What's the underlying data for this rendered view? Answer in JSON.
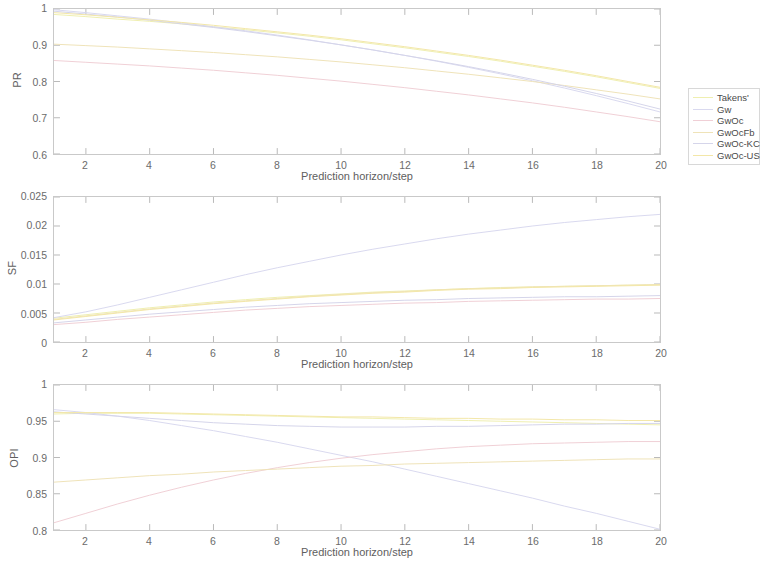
{
  "figure": {
    "xlabel": "Prediction horizon/step",
    "xticks": [
      "2",
      "4",
      "6",
      "8",
      "10",
      "12",
      "14",
      "16",
      "18",
      "20"
    ],
    "xlim": [
      1,
      20
    ]
  },
  "legend": {
    "entries": [
      {
        "label": "Takens'",
        "color": "#efefb0"
      },
      {
        "label": "Gw",
        "color": "#d9d9ef"
      },
      {
        "label": "GwOc",
        "color": "#f0cfd6"
      },
      {
        "label": "GwOcFb",
        "color": "#efe3b8"
      },
      {
        "label": "GwOc-KC",
        "color": "#d5d5ea"
      },
      {
        "label": "GwOc-US",
        "color": "#f3e7a8"
      }
    ]
  },
  "chart_data": [
    {
      "type": "line",
      "title": "",
      "panel": "PR",
      "ylabel": "PR",
      "xlabel": "Prediction horizon/step",
      "x": [
        1,
        2,
        3,
        4,
        5,
        6,
        7,
        8,
        9,
        10,
        11,
        12,
        13,
        14,
        15,
        16,
        17,
        18,
        19,
        20
      ],
      "ylim": [
        0.6,
        1.0
      ],
      "yticks": [
        "0.6",
        "0.7",
        "0.8",
        "0.9",
        "1"
      ],
      "xlim": [
        1,
        20
      ],
      "grid": false,
      "legend_position": "right-outside",
      "series": [
        {
          "name": "Takens'",
          "color": "#efefb0",
          "values": [
            0.985,
            0.979,
            0.972,
            0.966,
            0.959,
            0.951,
            0.943,
            0.934,
            0.925,
            0.915,
            0.904,
            0.893,
            0.881,
            0.869,
            0.856,
            0.842,
            0.828,
            0.813,
            0.797,
            0.781
          ]
        },
        {
          "name": "Gw",
          "color": "#d9d9ef",
          "values": [
            0.998,
            0.99,
            0.981,
            0.972,
            0.962,
            0.951,
            0.94,
            0.928,
            0.915,
            0.901,
            0.887,
            0.872,
            0.856,
            0.839,
            0.821,
            0.802,
            0.782,
            0.761,
            0.739,
            0.716
          ]
        },
        {
          "name": "GwOc",
          "color": "#f0cfd6",
          "values": [
            0.858,
            0.853,
            0.848,
            0.843,
            0.837,
            0.831,
            0.824,
            0.817,
            0.809,
            0.801,
            0.792,
            0.783,
            0.773,
            0.763,
            0.752,
            0.741,
            0.729,
            0.716,
            0.703,
            0.689
          ]
        },
        {
          "name": "GwOcFb",
          "color": "#efe3b8",
          "values": [
            0.903,
            0.899,
            0.895,
            0.89,
            0.885,
            0.88,
            0.874,
            0.868,
            0.861,
            0.854,
            0.846,
            0.838,
            0.829,
            0.82,
            0.81,
            0.8,
            0.789,
            0.777,
            0.765,
            0.752
          ]
        },
        {
          "name": "GwOc-KC",
          "color": "#d5d5ea",
          "values": [
            0.994,
            0.986,
            0.978,
            0.969,
            0.959,
            0.949,
            0.938,
            0.926,
            0.914,
            0.901,
            0.887,
            0.872,
            0.857,
            0.841,
            0.824,
            0.806,
            0.787,
            0.767,
            0.746,
            0.724
          ]
        },
        {
          "name": "GwOc-US",
          "color": "#f3e7a8",
          "values": [
            0.99,
            0.984,
            0.977,
            0.97,
            0.963,
            0.955,
            0.946,
            0.937,
            0.928,
            0.918,
            0.907,
            0.896,
            0.884,
            0.872,
            0.859,
            0.845,
            0.831,
            0.816,
            0.8,
            0.784
          ]
        }
      ]
    },
    {
      "type": "line",
      "title": "",
      "panel": "SF",
      "ylabel": "SF",
      "xlabel": "Prediction horizon/step",
      "x": [
        1,
        2,
        3,
        4,
        5,
        6,
        7,
        8,
        9,
        10,
        11,
        12,
        13,
        14,
        15,
        16,
        17,
        18,
        19,
        20
      ],
      "ylim": [
        0,
        0.025
      ],
      "yticks": [
        "0",
        "0.005",
        "0.01",
        "0.015",
        "0.02",
        "0.025"
      ],
      "xlim": [
        1,
        20
      ],
      "grid": false,
      "legend_position": "right-outside",
      "series": [
        {
          "name": "Takens'",
          "color": "#efefb0",
          "values": [
            0.0041,
            0.0047,
            0.0053,
            0.0059,
            0.0064,
            0.0069,
            0.0073,
            0.0077,
            0.008,
            0.0083,
            0.0086,
            0.0088,
            0.009,
            0.0092,
            0.0094,
            0.0095,
            0.0096,
            0.0097,
            0.0098,
            0.0099
          ]
        },
        {
          "name": "Gw",
          "color": "#d9d9ef",
          "values": [
            0.0042,
            0.0052,
            0.0064,
            0.0077,
            0.009,
            0.0103,
            0.0116,
            0.0128,
            0.0139,
            0.015,
            0.016,
            0.0169,
            0.0178,
            0.0186,
            0.0193,
            0.02,
            0.0206,
            0.0211,
            0.0216,
            0.022
          ]
        },
        {
          "name": "GwOc",
          "color": "#f0cfd6",
          "values": [
            0.003,
            0.0034,
            0.0039,
            0.0043,
            0.0047,
            0.0051,
            0.0055,
            0.0058,
            0.0061,
            0.0063,
            0.0065,
            0.0067,
            0.0068,
            0.007,
            0.0071,
            0.0072,
            0.0073,
            0.0074,
            0.0074,
            0.0075
          ]
        },
        {
          "name": "GwOcFb",
          "color": "#efe3b8",
          "values": [
            0.0039,
            0.0045,
            0.0051,
            0.0057,
            0.0062,
            0.0067,
            0.0071,
            0.0075,
            0.0079,
            0.0082,
            0.0085,
            0.0087,
            0.009,
            0.0092,
            0.0093,
            0.0095,
            0.0096,
            0.0097,
            0.0098,
            0.0099
          ]
        },
        {
          "name": "GwOc-KC",
          "color": "#d5d5ea",
          "values": [
            0.0033,
            0.0038,
            0.0043,
            0.0048,
            0.0052,
            0.0056,
            0.006,
            0.0063,
            0.0066,
            0.0068,
            0.007,
            0.0072,
            0.0073,
            0.0075,
            0.0076,
            0.0077,
            0.0078,
            0.0078,
            0.0079,
            0.008
          ]
        },
        {
          "name": "GwOc-US",
          "color": "#f3e7a8",
          "values": [
            0.0038,
            0.0044,
            0.005,
            0.0056,
            0.0061,
            0.0066,
            0.007,
            0.0074,
            0.0078,
            0.0081,
            0.0084,
            0.0086,
            0.0089,
            0.0091,
            0.0092,
            0.0094,
            0.0095,
            0.0096,
            0.0097,
            0.0098
          ]
        }
      ]
    },
    {
      "type": "line",
      "title": "",
      "panel": "OPI",
      "ylabel": "OPI",
      "xlabel": "Prediction horizon/step",
      "x": [
        1,
        2,
        3,
        4,
        5,
        6,
        7,
        8,
        9,
        10,
        11,
        12,
        13,
        14,
        15,
        16,
        17,
        18,
        19,
        20
      ],
      "ylim": [
        0.8,
        1.0
      ],
      "yticks": [
        "0.8",
        "0.85",
        "0.9",
        "0.95",
        "1"
      ],
      "xlim": [
        1,
        20
      ],
      "grid": false,
      "legend_position": "right-outside",
      "series": [
        {
          "name": "Takens'",
          "color": "#efefb0",
          "values": [
            0.96,
            0.961,
            0.961,
            0.961,
            0.96,
            0.959,
            0.958,
            0.957,
            0.956,
            0.955,
            0.954,
            0.953,
            0.952,
            0.951,
            0.95,
            0.949,
            0.948,
            0.947,
            0.946,
            0.945
          ]
        },
        {
          "name": "Gw",
          "color": "#d9d9ef",
          "values": [
            0.966,
            0.962,
            0.957,
            0.951,
            0.944,
            0.937,
            0.929,
            0.921,
            0.912,
            0.903,
            0.894,
            0.884,
            0.874,
            0.864,
            0.854,
            0.844,
            0.833,
            0.823,
            0.812,
            0.801
          ]
        },
        {
          "name": "GwOc",
          "color": "#f0cfd6",
          "values": [
            0.81,
            0.823,
            0.836,
            0.848,
            0.859,
            0.869,
            0.878,
            0.886,
            0.893,
            0.899,
            0.904,
            0.908,
            0.912,
            0.915,
            0.917,
            0.919,
            0.92,
            0.921,
            0.922,
            0.922
          ]
        },
        {
          "name": "GwOcFb",
          "color": "#efe3b8",
          "values": [
            0.866,
            0.869,
            0.872,
            0.875,
            0.877,
            0.88,
            0.882,
            0.884,
            0.886,
            0.888,
            0.889,
            0.891,
            0.892,
            0.893,
            0.894,
            0.895,
            0.896,
            0.897,
            0.898,
            0.898
          ]
        },
        {
          "name": "GwOc-KC",
          "color": "#d5d5ea",
          "values": [
            0.963,
            0.96,
            0.957,
            0.954,
            0.951,
            0.948,
            0.946,
            0.944,
            0.943,
            0.942,
            0.942,
            0.942,
            0.943,
            0.943,
            0.944,
            0.945,
            0.946,
            0.946,
            0.947,
            0.947
          ]
        },
        {
          "name": "GwOc-US",
          "color": "#f3e7a8",
          "values": [
            0.962,
            0.962,
            0.962,
            0.962,
            0.961,
            0.96,
            0.959,
            0.958,
            0.957,
            0.956,
            0.956,
            0.955,
            0.954,
            0.954,
            0.953,
            0.953,
            0.952,
            0.952,
            0.951,
            0.951
          ]
        }
      ]
    }
  ]
}
